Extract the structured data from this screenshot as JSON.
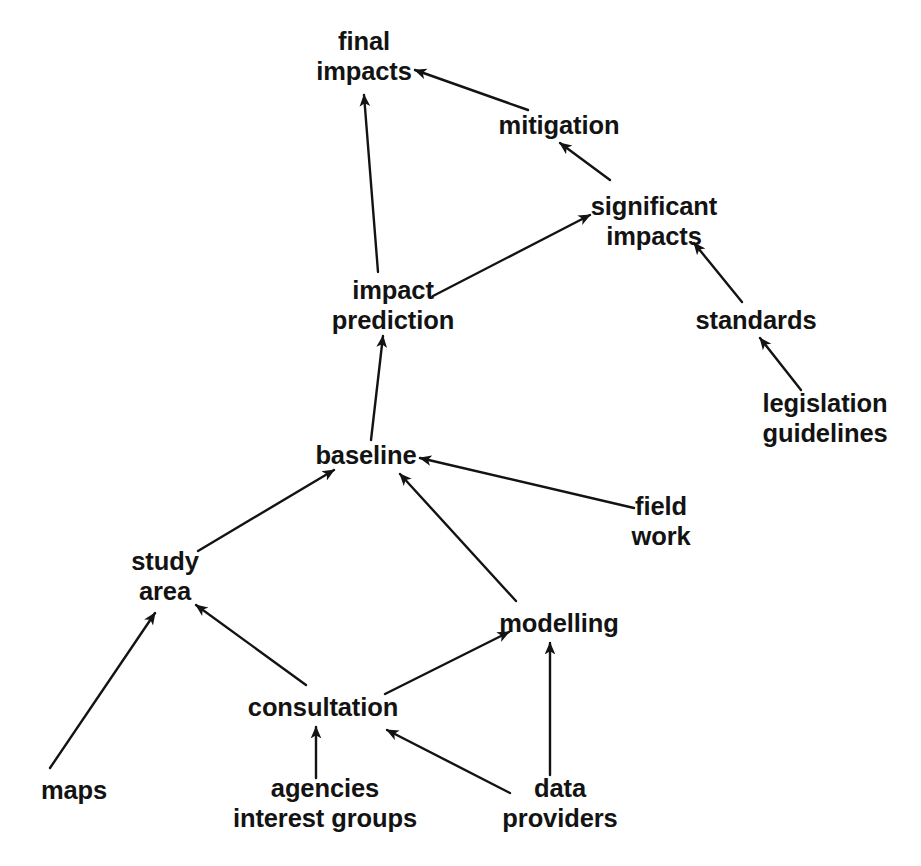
{
  "diagram": {
    "type": "directed-graph",
    "background_color": "#ffffff",
    "stroke_color": "#131313",
    "text_color": "#131313",
    "nodes": [
      {
        "id": "final-impacts",
        "line1": "final",
        "line2": "impacts",
        "x": 364,
        "y": 56
      },
      {
        "id": "mitigation",
        "line1": "mitigation",
        "line2": "",
        "x": 559,
        "y": 125
      },
      {
        "id": "significant-impacts",
        "line1": "significant",
        "line2": "impacts",
        "x": 654,
        "y": 221
      },
      {
        "id": "impact-prediction",
        "line1": "impact",
        "line2": "prediction",
        "x": 393,
        "y": 305
      },
      {
        "id": "standards",
        "line1": "standards",
        "line2": "",
        "x": 756,
        "y": 320
      },
      {
        "id": "legislation-guidelines",
        "line1": "legislation",
        "line2": "guidelines",
        "x": 825,
        "y": 418
      },
      {
        "id": "baseline",
        "line1": "baseline",
        "line2": "",
        "x": 366,
        "y": 455
      },
      {
        "id": "field-work",
        "line1": "field",
        "line2": "work",
        "x": 661,
        "y": 521
      },
      {
        "id": "study-area",
        "line1": "study",
        "line2": "area",
        "x": 165,
        "y": 576
      },
      {
        "id": "modelling",
        "line1": "modelling",
        "line2": "",
        "x": 559,
        "y": 623
      },
      {
        "id": "consultation",
        "line1": "consultation",
        "line2": "",
        "x": 323,
        "y": 707
      },
      {
        "id": "maps",
        "line1": "maps",
        "line2": "",
        "x": 74,
        "y": 790
      },
      {
        "id": "agencies-interest-groups",
        "line1": "agencies",
        "line2": "interest groups",
        "x": 325,
        "y": 803
      },
      {
        "id": "data-providers",
        "line1": "data",
        "line2": "providers",
        "x": 560,
        "y": 803
      }
    ],
    "edges": [
      {
        "id": "edge-mitigation-to-final-impacts",
        "from": "mitigation",
        "to": "final-impacts",
        "label": "mitigation → final impacts"
      },
      {
        "id": "edge-impact-prediction-to-final-impacts",
        "from": "impact-prediction",
        "to": "final-impacts",
        "label": "impact prediction → final impacts"
      },
      {
        "id": "edge-significant-impacts-to-mitigation",
        "from": "significant-impacts",
        "to": "mitigation",
        "label": "significant impacts → mitigation"
      },
      {
        "id": "edge-impact-prediction-to-significant-impacts",
        "from": "impact-prediction",
        "to": "significant-impacts",
        "label": "impact prediction → significant impacts"
      },
      {
        "id": "edge-standards-to-significant-impacts",
        "from": "standards",
        "to": "significant-impacts",
        "label": "standards → significant impacts"
      },
      {
        "id": "edge-legislation-to-standards",
        "from": "legislation-guidelines",
        "to": "standards",
        "label": "legislation guidelines → standards"
      },
      {
        "id": "edge-baseline-to-impact-prediction",
        "from": "baseline",
        "to": "impact-prediction",
        "label": "baseline → impact prediction"
      },
      {
        "id": "edge-study-area-to-baseline",
        "from": "study-area",
        "to": "baseline",
        "label": "study area → baseline"
      },
      {
        "id": "edge-modelling-to-baseline",
        "from": "modelling",
        "to": "baseline",
        "label": "modelling → baseline"
      },
      {
        "id": "edge-field-work-to-baseline",
        "from": "field-work",
        "to": "baseline",
        "label": "field work → baseline"
      },
      {
        "id": "edge-maps-to-study-area",
        "from": "maps",
        "to": "study-area",
        "label": "maps → study area"
      },
      {
        "id": "edge-consultation-to-study-area",
        "from": "consultation",
        "to": "study-area",
        "label": "consultation → study area"
      },
      {
        "id": "edge-consultation-to-modelling",
        "from": "consultation",
        "to": "modelling",
        "label": "consultation → modelling"
      },
      {
        "id": "edge-agencies-to-consultation",
        "from": "agencies-interest-groups",
        "to": "consultation",
        "label": "agencies interest groups → consultation"
      },
      {
        "id": "edge-data-providers-to-consultation",
        "from": "data-providers",
        "to": "consultation",
        "label": "data providers → consultation"
      },
      {
        "id": "edge-data-providers-to-modelling",
        "from": "data-providers",
        "to": "modelling",
        "label": "data providers → modelling"
      }
    ]
  }
}
